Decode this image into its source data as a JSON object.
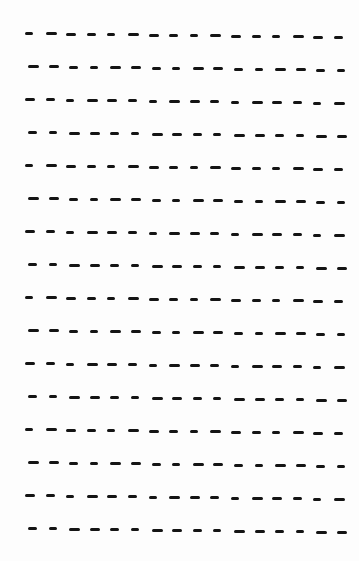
{
  "page": {
    "background": "#fdfdfd",
    "ink_color": "#141414"
  },
  "pattern": {
    "rows": 16,
    "dashes_per_row": 16,
    "first_row_y": 32,
    "row_spacing": 33,
    "dash_spacing": 20.6,
    "dash_width": 9,
    "row_slope_px": 4,
    "row_start_x": [
      25,
      28,
      25,
      28,
      25,
      28,
      25,
      28,
      25,
      28,
      25,
      28,
      25,
      28,
      25,
      28
    ]
  }
}
